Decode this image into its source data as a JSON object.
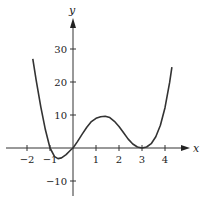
{
  "chart_data": {
    "type": "line",
    "title": "",
    "xlabel": "x",
    "ylabel": "y",
    "xlim": [
      -2.5,
      4.8
    ],
    "ylim": [
      -15,
      37
    ],
    "grid": false,
    "legend": null,
    "x_ticks": [
      -2,
      -1,
      1,
      2,
      3,
      4
    ],
    "x_tick_labels": [
      "−2",
      "−1",
      "1",
      "2",
      "3",
      "4"
    ],
    "y_ticks": [
      30,
      20,
      10,
      -10
    ],
    "y_tick_labels": [
      "30",
      "20",
      "10",
      "−10"
    ],
    "series": [
      {
        "name": "f(x)",
        "color": "#333333",
        "x": [
          -1.75,
          -1.6,
          -1.4,
          -1.2,
          -1.0,
          -0.8,
          -0.65,
          -0.5,
          -0.3,
          -0.1,
          0.0,
          0.2,
          0.4,
          0.6,
          0.8,
          1.0,
          1.2,
          1.4,
          1.6,
          1.8,
          2.0,
          2.2,
          2.4,
          2.6,
          2.8,
          3.0,
          3.2,
          3.4,
          3.6,
          3.8,
          4.0,
          4.2,
          4.3
        ],
        "y": [
          27,
          20.5,
          12.5,
          5.5,
          0,
          -2.6,
          -3.2,
          -3.0,
          -2.0,
          -0.6,
          0,
          2.0,
          4.2,
          6.3,
          8.0,
          9.0,
          9.5,
          9.6,
          9.2,
          8.1,
          6.5,
          4.6,
          2.7,
          1.2,
          0.3,
          0,
          0.3,
          1.3,
          3.4,
          6.9,
          12.2,
          19.8,
          24.5
        ]
      }
    ]
  },
  "axes": {
    "x_label": "x",
    "y_label": "y"
  }
}
